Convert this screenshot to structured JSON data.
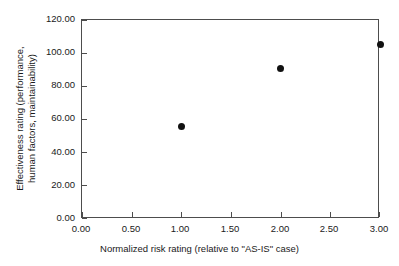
{
  "chart_data": {
    "type": "scatter",
    "title": "",
    "xlabel": "Normalized risk rating (relative to \"AS-IS\" case)",
    "ylabel_line1": "Effectiveness rating (performance,",
    "ylabel_line2": "human factors, maintainability)",
    "ylabel": "Effectiveness rating (performance, human factors, maintainability)",
    "xlim": [
      0.0,
      3.0
    ],
    "ylim": [
      0.0,
      120.0
    ],
    "xticks": [
      0.0,
      0.5,
      1.0,
      1.5,
      2.0,
      2.5,
      3.0
    ],
    "yticks": [
      0.0,
      20.0,
      40.0,
      60.0,
      80.0,
      100.0,
      120.0
    ],
    "xticklabels": [
      "0.00",
      "0.50",
      "1.00",
      "1.50",
      "2.00",
      "2.50",
      "3.00"
    ],
    "yticklabels": [
      "0.00",
      "20.00",
      "40.00",
      "60.00",
      "80.00",
      "100.00",
      "120.00"
    ],
    "grid": false,
    "legend": false,
    "legend_position": "none",
    "marker": "circle",
    "marker_color": "#111111",
    "marker_size": 7,
    "x": [
      1.0,
      2.0,
      3.0
    ],
    "y": [
      56.0,
      91.0,
      105.0
    ],
    "points": [
      {
        "x": 1.0,
        "y": 56.0
      },
      {
        "x": 2.0,
        "y": 91.0
      },
      {
        "x": 3.0,
        "y": 105.0
      }
    ],
    "series": [
      {
        "name": "Effectiveness rating",
        "x": [
          1.0,
          2.0,
          3.0
        ],
        "values": [
          56.0,
          91.0,
          105.0
        ]
      }
    ],
    "axis_color": "#4d4d4d",
    "background_color": "#ffffff"
  }
}
